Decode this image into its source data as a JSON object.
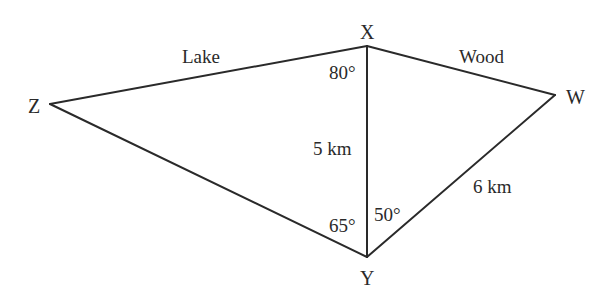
{
  "diagram": {
    "type": "quadrilateral-with-diagonal",
    "line_color": "#2a2a2a",
    "vertices": {
      "X": {
        "label": "X",
        "x": 367,
        "y": 46
      },
      "W": {
        "label": "W",
        "x": 555,
        "y": 95
      },
      "Y": {
        "label": "Y",
        "x": 367,
        "y": 257
      },
      "Z": {
        "label": "Z",
        "x": 50,
        "y": 104
      }
    },
    "edges": [
      {
        "from": "Z",
        "to": "X",
        "label": "Lake"
      },
      {
        "from": "X",
        "to": "W",
        "label": "Wood"
      },
      {
        "from": "X",
        "to": "Y",
        "label": "5 km"
      },
      {
        "from": "Y",
        "to": "W",
        "label": "6 km"
      },
      {
        "from": "Z",
        "to": "Y",
        "label": ""
      }
    ],
    "edge_labels": {
      "lake": "Lake",
      "wood": "Wood",
      "xy": "5 km",
      "yw": "6 km"
    },
    "angles": {
      "zxy": "80°",
      "zyx": "65°",
      "xyw": "50°"
    }
  }
}
